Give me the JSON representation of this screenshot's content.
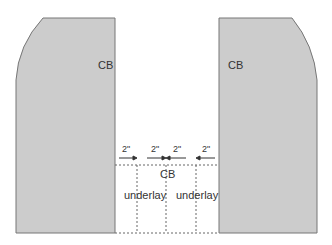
{
  "diagram": {
    "left_panel": {
      "label": "CB",
      "fill": "#cccccc",
      "stroke": "#777777"
    },
    "right_panel": {
      "label": "CB",
      "fill": "#cccccc",
      "stroke": "#777777"
    },
    "gap": {
      "center_label": "CB",
      "underlays": [
        {
          "label": "underlay"
        },
        {
          "label": "underlay"
        }
      ],
      "measurements": [
        {
          "label": "2\"",
          "direction": "right"
        },
        {
          "label": "2\"",
          "direction": "right"
        },
        {
          "label": "2\"",
          "direction": "left"
        },
        {
          "label": "2\"",
          "direction": "left"
        }
      ]
    }
  }
}
